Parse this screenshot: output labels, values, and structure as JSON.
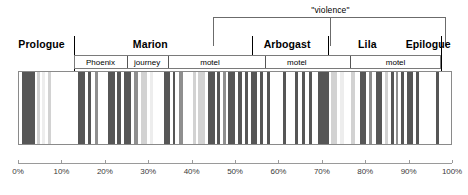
{
  "figure": {
    "type": "barcode-timeline"
  },
  "brackets": [
    {
      "label": "\"violence\"",
      "start_pct": 45.0,
      "end_pct": 98.5,
      "center_pct": 72.0
    }
  ],
  "acts": [
    {
      "label": "Prologue",
      "tick_pct": 13.0,
      "label_pct": 1.0,
      "align": "left"
    },
    {
      "label": "Marion",
      "tick_pct": null,
      "label_pct": 30.5,
      "align": "center"
    },
    {
      "label": "Arbogast",
      "tick_pct": 54.0,
      "label_pct": 62.0,
      "align": "center"
    },
    {
      "label": "Lila",
      "tick_pct": 71.5,
      "label_pct": 80.5,
      "align": "center"
    },
    {
      "label": "Epilogue",
      "tick_pct": 97.5,
      "label_pct": 99.0,
      "align": "right"
    }
  ],
  "scene_bands": [
    {
      "label": "Phoenix",
      "start_pct": 13.0,
      "end_pct": 25.0
    },
    {
      "label": "journey",
      "start_pct": 25.0,
      "end_pct": 34.5
    },
    {
      "label": "motel",
      "start_pct": 34.5,
      "end_pct": 54.0
    },
    {
      "label": "motel",
      "start_pct": 57.0,
      "end_pct": 71.5
    },
    {
      "label": "motel",
      "start_pct": 76.5,
      "end_pct": 97.5
    }
  ],
  "band_extent": {
    "start_pct": 13.0,
    "end_pct": 97.5
  },
  "axis": {
    "min_pct": 0,
    "max_pct": 100,
    "step_pct": 10,
    "ticks": [
      "0%",
      "10%",
      "20%",
      "30%",
      "40%",
      "50%",
      "60%",
      "70%",
      "80%",
      "90%",
      "100%"
    ]
  },
  "colors": {
    "dark_bar": "#565656",
    "mid_bar": "#8f8f8f",
    "light_bar": "#d2d2d2",
    "pale_bar": "#ededed",
    "frame": "#8a8a8a",
    "axis": "#9a9a9a",
    "bracket": "#6b6b6b",
    "background": "#ffffff"
  },
  "chart_data": {
    "type": "bar",
    "title": "",
    "xlabel": "",
    "ylabel": "",
    "xlim": [
      0,
      100
    ],
    "grid": false,
    "legend": false,
    "note": "Each bar is a shot; x = position in film (%), shade = tone.",
    "bars": [
      {
        "x": 0.8,
        "w": 3.0,
        "tone": "dark"
      },
      {
        "x": 4.2,
        "w": 0.7,
        "tone": "light"
      },
      {
        "x": 5.4,
        "w": 0.6,
        "tone": "pale"
      },
      {
        "x": 6.6,
        "w": 0.7,
        "tone": "light"
      },
      {
        "x": 13.6,
        "w": 1.6,
        "tone": "dark"
      },
      {
        "x": 15.8,
        "w": 0.8,
        "tone": "dark"
      },
      {
        "x": 17.6,
        "w": 0.6,
        "tone": "mid"
      },
      {
        "x": 20.6,
        "w": 1.6,
        "tone": "dark"
      },
      {
        "x": 22.6,
        "w": 0.8,
        "tone": "dark"
      },
      {
        "x": 24.2,
        "w": 1.5,
        "tone": "dark"
      },
      {
        "x": 26.6,
        "w": 0.8,
        "tone": "mid"
      },
      {
        "x": 28.0,
        "w": 1.5,
        "tone": "light"
      },
      {
        "x": 30.2,
        "w": 0.6,
        "tone": "pale"
      },
      {
        "x": 33.4,
        "w": 1.4,
        "tone": "dark"
      },
      {
        "x": 35.4,
        "w": 0.6,
        "tone": "dark"
      },
      {
        "x": 36.8,
        "w": 1.0,
        "tone": "mid"
      },
      {
        "x": 40.0,
        "w": 0.7,
        "tone": "light"
      },
      {
        "x": 41.3,
        "w": 1.6,
        "tone": "light"
      },
      {
        "x": 43.6,
        "w": 1.5,
        "tone": "dark"
      },
      {
        "x": 45.6,
        "w": 0.7,
        "tone": "dark"
      },
      {
        "x": 47.0,
        "w": 0.7,
        "tone": "mid"
      },
      {
        "x": 48.2,
        "w": 1.6,
        "tone": "dark"
      },
      {
        "x": 50.4,
        "w": 1.0,
        "tone": "dark"
      },
      {
        "x": 52.0,
        "w": 0.8,
        "tone": "dark"
      },
      {
        "x": 53.4,
        "w": 1.4,
        "tone": "dark"
      },
      {
        "x": 55.6,
        "w": 0.7,
        "tone": "dark"
      },
      {
        "x": 57.2,
        "w": 0.7,
        "tone": "dark"
      },
      {
        "x": 60.8,
        "w": 0.7,
        "tone": "dark"
      },
      {
        "x": 63.6,
        "w": 0.8,
        "tone": "dark"
      },
      {
        "x": 65.2,
        "w": 0.7,
        "tone": "dark"
      },
      {
        "x": 66.8,
        "w": 0.6,
        "tone": "dark"
      },
      {
        "x": 68.8,
        "w": 2.6,
        "tone": "dark"
      },
      {
        "x": 72.0,
        "w": 1.2,
        "tone": "light"
      },
      {
        "x": 74.0,
        "w": 0.8,
        "tone": "pale"
      },
      {
        "x": 76.4,
        "w": 1.0,
        "tone": "light"
      },
      {
        "x": 78.6,
        "w": 1.4,
        "tone": "dark"
      },
      {
        "x": 80.6,
        "w": 0.7,
        "tone": "mid"
      },
      {
        "x": 82.2,
        "w": 1.5,
        "tone": "dark"
      },
      {
        "x": 84.4,
        "w": 0.6,
        "tone": "light"
      },
      {
        "x": 85.6,
        "w": 0.7,
        "tone": "dark"
      },
      {
        "x": 86.8,
        "w": 0.5,
        "tone": "mid"
      },
      {
        "x": 88.0,
        "w": 0.8,
        "tone": "dark"
      },
      {
        "x": 89.4,
        "w": 1.5,
        "tone": "dark"
      },
      {
        "x": 91.4,
        "w": 0.7,
        "tone": "dark"
      },
      {
        "x": 96.0,
        "w": 0.8,
        "tone": "dark"
      }
    ]
  }
}
